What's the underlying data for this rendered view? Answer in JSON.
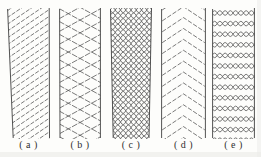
{
  "figure": {
    "background": "#fdfdfb",
    "colors": {
      "line": "#4f4f4f",
      "border": "#3f3f3f",
      "label": "#2e2e2e"
    },
    "panels": [
      {
        "id": "a",
        "label": "( a )",
        "pattern": "diagonal-hatch"
      },
      {
        "id": "b",
        "label": "( b )",
        "pattern": "cross-lattice"
      },
      {
        "id": "c",
        "label": "( c )",
        "pattern": "dense-diamond-mesh"
      },
      {
        "id": "d",
        "label": "( d )",
        "pattern": "chevron"
      },
      {
        "id": "e",
        "label": "( e )",
        "pattern": "wave-rows"
      }
    ]
  }
}
